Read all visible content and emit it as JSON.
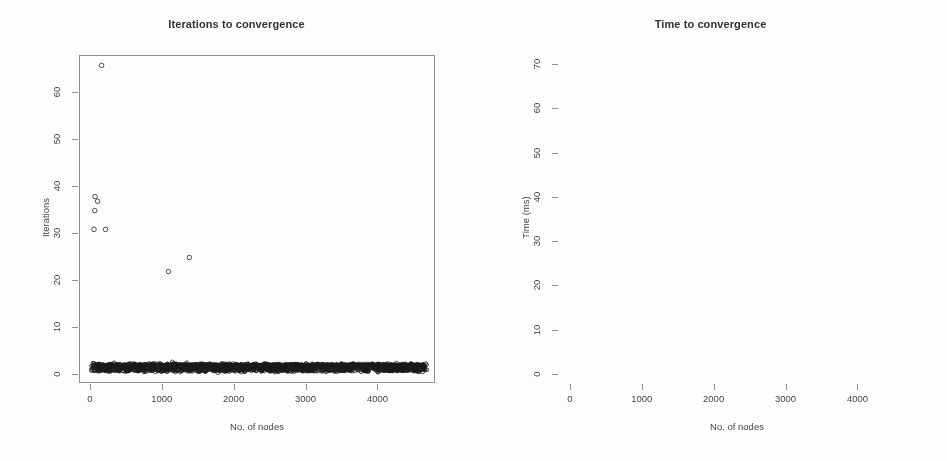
{
  "figure": {
    "background": "#ffffff",
    "ink_color": "#1c1c1c",
    "axis_color": "#8d8d8d",
    "panel_count": 2
  },
  "chart_data": [
    {
      "panel": "left",
      "type": "scatter",
      "title": "Iterations to convergence",
      "xlabel": "No. of nodes",
      "ylabel": "Iterations",
      "xlim": [
        -150,
        4800
      ],
      "ylim": [
        -2,
        68
      ],
      "xticks": [
        0,
        1000,
        2000,
        3000,
        4000
      ],
      "xticklabels": [
        "0",
        "1000",
        "2000",
        "3000",
        "4000"
      ],
      "yticks": [
        0,
        10,
        20,
        30,
        40,
        50,
        60
      ],
      "yticklabels": [
        "0",
        "10",
        "20",
        "30",
        "40",
        "50",
        "60"
      ],
      "grid": false,
      "legend": null,
      "marker": "open-circle",
      "description": "Dense horizontal band of points at 1-2 iterations spanning the full range of node counts, with a handful of high outliers at small node counts.",
      "outliers": [
        {
          "x": 150,
          "y": 66
        },
        {
          "x": 60,
          "y": 38
        },
        {
          "x": 95,
          "y": 37
        },
        {
          "x": 55,
          "y": 35
        },
        {
          "x": 45,
          "y": 31
        },
        {
          "x": 205,
          "y": 31
        },
        {
          "x": 1080,
          "y": 22
        },
        {
          "x": 1370,
          "y": 25
        },
        {
          "x": 10,
          "y": 1
        }
      ],
      "dense_band": {
        "y_range": [
          1,
          2
        ],
        "x_range": [
          20,
          4650
        ],
        "n_points": 1400
      }
    },
    {
      "panel": "right",
      "type": "scatter",
      "title": "Time to convergence",
      "xlabel": "No. of nodes",
      "ylabel": "Time (ms)",
      "xlim": [
        -150,
        4800
      ],
      "ylim": [
        -2,
        72
      ],
      "xticks": [
        0,
        1000,
        2000,
        3000,
        4000
      ],
      "xticklabels": [
        "0",
        "1000",
        "2000",
        "3000",
        "4000"
      ],
      "yticks": [
        0,
        10,
        20,
        30,
        40,
        50,
        60,
        70
      ],
      "yticklabels": [
        "0",
        "10",
        "20",
        "30",
        "40",
        "50",
        "60",
        "70"
      ],
      "grid": false,
      "legend": null,
      "marker": "open-circle",
      "description": "Dense wedge-shaped cloud fanning out from the origin; convergence time grows roughly linearly with node count, upper edge reaching about 25-30 ms near 4200 nodes, with three high outliers.",
      "outliers": [
        {
          "x": 1100,
          "y": 60.5
        },
        {
          "x": 2950,
          "y": 69.5
        },
        {
          "x": 2950,
          "y": 55.0
        },
        {
          "x": 4100,
          "y": 35.5
        },
        {
          "x": 3600,
          "y": 33.5
        },
        {
          "x": 4450,
          "y": 31.5
        },
        {
          "x": 3700,
          "y": 30.5
        },
        {
          "x": 4250,
          "y": 29.5
        },
        {
          "x": 3350,
          "y": 27.5
        },
        {
          "x": 2600,
          "y": 22.5
        },
        {
          "x": 1250,
          "y": 12.5
        },
        {
          "x": 1100,
          "y": 11.8
        }
      ],
      "wedge": {
        "x_range": [
          10,
          4650
        ],
        "upper_slope_ms_per_1000_nodes": 6.2,
        "lower_slope_ms_per_1000_nodes": 0.15,
        "n_points": 4200
      }
    }
  ]
}
